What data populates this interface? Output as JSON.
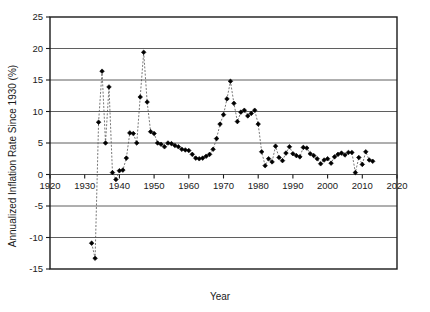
{
  "chart_data": {
    "type": "scatter",
    "title": "",
    "xlabel": "Year",
    "ylabel": "Annualized Inflation Rate Since 1930 (%)",
    "xlim": [
      1920,
      2020
    ],
    "ylim": [
      -15,
      25
    ],
    "xticks": [
      1920,
      1930,
      1940,
      1950,
      1960,
      1970,
      1980,
      1990,
      2000,
      2010,
      2020
    ],
    "yticks": [
      -15,
      -10,
      -5,
      0,
      5,
      10,
      15,
      20,
      25
    ],
    "xtick_labels": [
      "1920",
      "1930",
      "1940",
      "1950",
      "1960",
      "1970",
      "1980",
      "1990",
      "2000",
      "2010",
      "2020"
    ],
    "ytick_labels": [
      "-15",
      "-10",
      "-5",
      "0",
      "5",
      "10",
      "15",
      "20",
      "25"
    ],
    "grid": "horizontal",
    "legend": "none",
    "marker": "filled-diamond",
    "line_style": "dashed",
    "line_color": "#555555",
    "marker_color": "#000000",
    "series": [
      {
        "name": "Annualized Inflation Rate Since 1930",
        "x": [
          1932,
          1933,
          1934,
          1935,
          1936,
          1937,
          1938,
          1939,
          1940,
          1941,
          1942,
          1943,
          1944,
          1945,
          1946,
          1947,
          1948,
          1949,
          1950,
          1951,
          1952,
          1953,
          1954,
          1955,
          1956,
          1957,
          1958,
          1959,
          1960,
          1961,
          1962,
          1963,
          1964,
          1965,
          1966,
          1967,
          1968,
          1969,
          1970,
          1971,
          1972,
          1973,
          1974,
          1975,
          1976,
          1977,
          1978,
          1979,
          1980,
          1981,
          1982,
          1983,
          1984,
          1985,
          1986,
          1987,
          1988,
          1989,
          1990,
          1991,
          1992,
          1993,
          1994,
          1995,
          1996,
          1997,
          1998,
          1999,
          2000,
          2001,
          2002,
          2003,
          2004,
          2005,
          2006,
          2007,
          2008,
          2009,
          2010,
          2011,
          2012,
          2013
        ],
        "values": [
          -10.9,
          -13.3,
          8.3,
          16.4,
          5.0,
          13.9,
          0.3,
          -0.8,
          0.6,
          0.7,
          2.6,
          6.6,
          6.5,
          5.0,
          12.3,
          19.4,
          11.5,
          6.8,
          6.5,
          5.0,
          4.8,
          4.4,
          5.0,
          4.9,
          4.6,
          4.4,
          4.0,
          3.9,
          3.8,
          3.2,
          2.6,
          2.5,
          2.6,
          2.9,
          3.2,
          4.0,
          5.7,
          8.0,
          9.5,
          12.0,
          14.8,
          11.3,
          8.4,
          9.9,
          10.2,
          9.3,
          9.7,
          10.2,
          8.0,
          3.6,
          1.4,
          2.5,
          2.0,
          4.5,
          2.7,
          2.2,
          3.4,
          4.4,
          3.3,
          3.0,
          2.8,
          4.3,
          4.2,
          3.3,
          3.0,
          2.5,
          1.7,
          2.3,
          2.5,
          1.8,
          2.8,
          3.2,
          3.4,
          3.1,
          3.5,
          3.5,
          0.3,
          2.7,
          1.6,
          3.6,
          2.3,
          2.1
        ]
      }
    ]
  },
  "axis": {
    "ylabel": "Annualized Inflation Rate Since 1930 (%)",
    "xlabel": "Year"
  }
}
